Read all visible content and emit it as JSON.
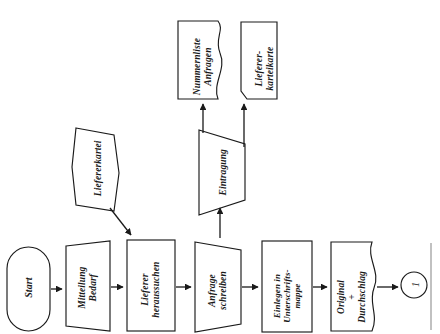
{
  "diagram": {
    "orientation": "rotated-90-ccw",
    "background_color": "#ffffff",
    "line_color": "#1a1a1a",
    "nodes": {
      "start": {
        "label": "Start",
        "shape": "terminator-stadium"
      },
      "mitteilung": {
        "label": "Mitteilung\nBedarf",
        "shape": "parallelogram-input"
      },
      "lieferer_heraussuchen": {
        "label": "Lieferer\nheraussuchen",
        "shape": "rectangle-process"
      },
      "anfrage_schreiben": {
        "label": "Anfrage\nschreiben",
        "shape": "trapezoid-manual-operation"
      },
      "einlegen": {
        "label": "Einlegen in\nUnterschrifts-\nmappe",
        "shape": "rectangle-process"
      },
      "original_durchschlag": {
        "label": "Original\n+\nDurchschlag",
        "shape": "document"
      },
      "connector_1": {
        "label": "1",
        "shape": "circle-connector"
      },
      "liefererkartei": {
        "label": "Liefererkartei",
        "shape": "cylinder-store"
      },
      "eintragung": {
        "label": "Eintragung",
        "shape": "trapezoid-manual-operation"
      },
      "nummernliste": {
        "label": "Nummernliste\nAnfragen",
        "shape": "document"
      },
      "lieferer_karteikarte": {
        "label": "Lieferer-\nkarteikarte",
        "shape": "document-cut-corner"
      }
    },
    "edges": [
      {
        "from": "start",
        "to": "mitteilung",
        "kind": "arrow"
      },
      {
        "from": "mitteilung",
        "to": "lieferer_heraussuchen",
        "kind": "arrow"
      },
      {
        "from": "lieferer_heraussuchen",
        "to": "anfrage_schreiben",
        "kind": "arrow"
      },
      {
        "from": "anfrage_schreiben",
        "to": "einlegen",
        "kind": "arrow"
      },
      {
        "from": "einlegen",
        "to": "original_durchschlag",
        "kind": "arrow"
      },
      {
        "from": "original_durchschlag",
        "to": "connector_1",
        "kind": "arrow"
      },
      {
        "from": "liefererkartei",
        "to": "lieferer_heraussuchen",
        "kind": "arrow-diagonal"
      },
      {
        "from": "anfrage_schreiben",
        "to": "eintragung",
        "kind": "arrow"
      },
      {
        "from": "eintragung",
        "to": "nummernliste",
        "kind": "arrow"
      },
      {
        "from": "eintragung",
        "to": "lieferer_karteikarte",
        "kind": "arrow"
      }
    ]
  }
}
